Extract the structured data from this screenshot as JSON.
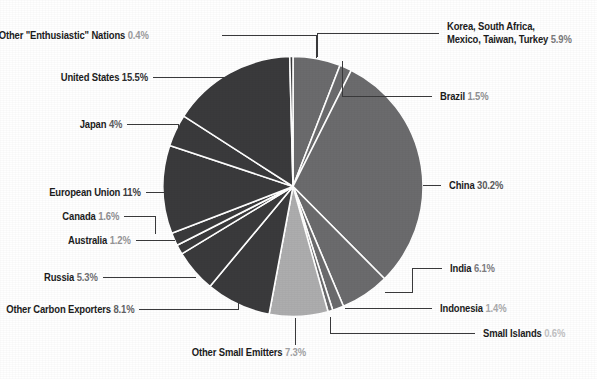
{
  "chart_data": {
    "type": "pie",
    "title": "",
    "subtitle": "",
    "xlabel": "",
    "ylabel": "",
    "legend_position": "callout-labels",
    "grid": false,
    "start_angle_deg": 0,
    "direction": "clockwise",
    "unit": "%",
    "colors": {
      "dark_gray": "#3a3a3c",
      "mid_gray": "#6b6b6d",
      "light_gray": "#adadae",
      "label_text": "#1c1c1c",
      "leader_line": "#3a3a3c",
      "background": "#ffffff"
    },
    "categories": [
      "Korea, South Africa, Mexico, Taiwan, Turkey",
      "Brazil",
      "China",
      "India",
      "Indonesia",
      "Small Islands",
      "Other Small Emitters",
      "Other Carbon Exporters",
      "Russia",
      "Australia",
      "Canada",
      "European Union",
      "Japan",
      "United States",
      "Other \"Enthusiastic\" Nations"
    ],
    "values": [
      5.9,
      1.5,
      30.2,
      6.1,
      1.4,
      0.6,
      7.3,
      8.1,
      5.3,
      1.2,
      1.6,
      11.0,
      4.0,
      15.5,
      0.4
    ],
    "slice_colors": [
      "#6b6b6d",
      "#6b6b6d",
      "#6b6b6d",
      "#6b6b6d",
      "#6b6b6d",
      "#6b6b6d",
      "#adadae",
      "#3a3a3c",
      "#3a3a3c",
      "#3a3a3c",
      "#3a3a3c",
      "#3a3a3c",
      "#3a3a3c",
      "#3a3a3c",
      "#3a3a3c"
    ]
  },
  "labels": {
    "korea_group": {
      "line1": "Korea, South Africa,",
      "line2": "Mexico, Taiwan, Turkey",
      "name": "Korea, South Africa, Mexico, Taiwan, Turkey",
      "pct": "5.9%"
    },
    "brazil": {
      "name": "Brazil",
      "pct": "1.5%"
    },
    "china": {
      "name": "China",
      "pct": "30.2%"
    },
    "india": {
      "name": "India",
      "pct": "6.1%"
    },
    "indonesia": {
      "name": "Indonesia",
      "pct": "1.4%"
    },
    "small_islands": {
      "name": "Small Islands",
      "pct": "0.6%"
    },
    "other_small_emitters": {
      "name": "Other Small Emitters",
      "pct": "7.3%"
    },
    "other_carbon_exporters": {
      "name": "Other Carbon Exporters",
      "pct": "8.1%"
    },
    "russia": {
      "name": "Russia",
      "pct": "5.3%"
    },
    "australia": {
      "name": "Australia",
      "pct": "1.2%"
    },
    "canada": {
      "name": "Canada",
      "pct": "1.6%"
    },
    "european_union": {
      "name": "European Union",
      "pct": "11%"
    },
    "japan": {
      "name": "Japan",
      "pct": "4%"
    },
    "united_states": {
      "name": "United States",
      "pct": "15.5%"
    },
    "other_enthusiastic": {
      "name": "Other \"Enthusiastic\" Nations",
      "pct": "0.4%"
    }
  }
}
